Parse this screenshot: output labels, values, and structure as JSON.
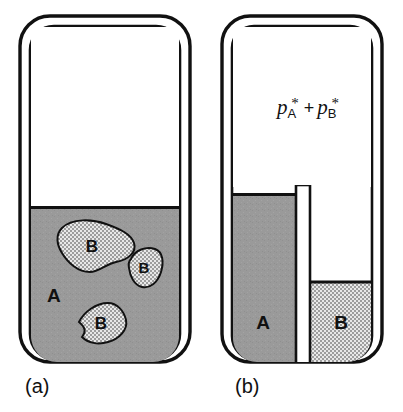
{
  "figure": {
    "background_color": "#ffffff",
    "ink_color": "#111111"
  },
  "colors": {
    "liquid_a_gray": "#9a9a9a",
    "liquid_b_light": "#d2d2d2",
    "blob_fill": "#d2d2d2",
    "outline": "#111111",
    "barrier_fill": "#ffffff",
    "vapour_space": "#ffffff"
  },
  "panels": [
    {
      "id": "panel-a",
      "caption": "(a)",
      "description": "mixture of A with dispersed B droplets",
      "liquid_bulk": {
        "label": "A",
        "fill": "#9a9a9a",
        "level_y": 207
      },
      "droplets": [
        {
          "label": "B",
          "cx": 92,
          "cy": 245
        },
        {
          "label": "B",
          "cx": 143,
          "cy": 268
        },
        {
          "label": "B",
          "cx": 98,
          "cy": 322
        }
      ]
    },
    {
      "id": "panel-b",
      "caption": "(b)",
      "description": "separated pure liquids A and B divided by a barrier",
      "vapour_formula": {
        "p_symbol": "p",
        "sub_a": "A",
        "sub_b": "B",
        "star": "*",
        "operator": "+",
        "plain_text": "p*A + p*B"
      },
      "left_liquid": {
        "label": "A",
        "fill": "#9a9a9a",
        "level_y": 194
      },
      "right_liquid": {
        "label": "B",
        "fill": "#d2d2d2",
        "level_y": 281
      },
      "barrier": {
        "name": "divider",
        "fill": "#ffffff",
        "top_y": 185
      }
    }
  ]
}
